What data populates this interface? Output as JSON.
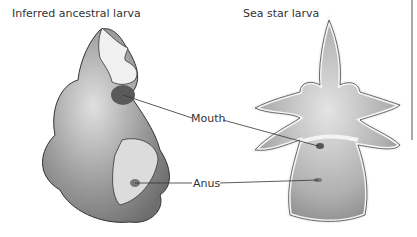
{
  "panels": {
    "left": {
      "title": "Inferred ancestral larva"
    },
    "right": {
      "title": "Sea star larva"
    }
  },
  "labels": {
    "mouth": "Mouth",
    "anus": "Anus"
  },
  "colors": {
    "body_dark": "#7a7a7a",
    "body_mid": "#a8a8a8",
    "body_light": "#d8d8d8",
    "band": "#f2f2f2",
    "line": "#333333",
    "frame": "#555555"
  }
}
